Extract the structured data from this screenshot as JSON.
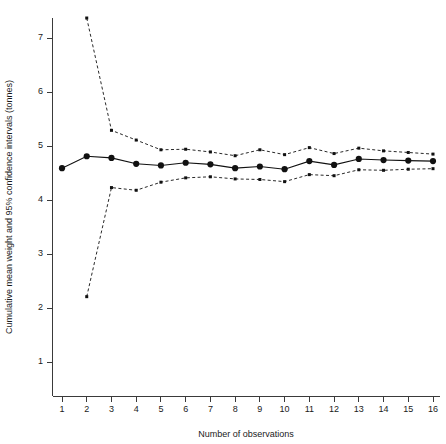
{
  "chart_data": {
    "type": "line",
    "title": "",
    "xlabel": "Number of observations",
    "ylabel": "Cumulative mean weight and 95% confidence intervals (tonnes)",
    "xlim": [
      0.4,
      16.6
    ],
    "ylim": [
      0.35,
      7.75
    ],
    "grid": false,
    "legend": null,
    "x": [
      1,
      2,
      3,
      4,
      5,
      6,
      7,
      8,
      9,
      10,
      11,
      12,
      13,
      14,
      15,
      16
    ],
    "xticks": [
      "1",
      "2",
      "3",
      "4",
      "5",
      "6",
      "7",
      "8",
      "9",
      "10",
      "11",
      "12",
      "13",
      "14",
      "15",
      "16"
    ],
    "yticks": [
      "1",
      "2",
      "3",
      "4",
      "5",
      "6",
      "7"
    ],
    "ytick_values": [
      1,
      2,
      3,
      4,
      5,
      6,
      7
    ],
    "series": [
      {
        "name": "Cumulative mean weight",
        "style": "solid-with-markers",
        "color": "#111111",
        "values": [
          4.59,
          4.81,
          4.78,
          4.67,
          4.64,
          4.69,
          4.66,
          4.59,
          4.62,
          4.57,
          4.72,
          4.65,
          4.76,
          4.74,
          4.73,
          4.72
        ]
      },
      {
        "name": "Upper 95% confidence interval",
        "style": "dashed-with-markers",
        "color": "#111111",
        "values": [
          null,
          7.37,
          5.29,
          5.11,
          4.93,
          4.94,
          4.89,
          4.82,
          4.93,
          4.84,
          4.97,
          4.86,
          4.96,
          4.91,
          4.88,
          4.85
        ]
      },
      {
        "name": "Lower 95% confidence interval",
        "style": "dashed-with-markers",
        "color": "#111111",
        "values": [
          null,
          2.21,
          4.23,
          4.18,
          4.33,
          4.41,
          4.43,
          4.39,
          4.38,
          4.34,
          4.47,
          4.45,
          4.56,
          4.55,
          4.57,
          4.58
        ]
      }
    ]
  },
  "axes": {
    "y_title": "Cumulative mean weight and 95% confidence intervals (tonnes)",
    "x_title": "Number of observations"
  }
}
